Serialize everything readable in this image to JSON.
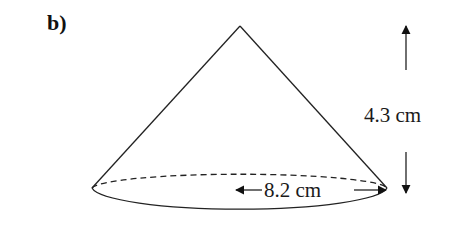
{
  "figure": {
    "part_label": "b)",
    "shape": "cone",
    "height_label": "4.3 cm",
    "diameter_label": "8.2 cm",
    "stroke_color": "#222222",
    "background": "#ffffff"
  }
}
